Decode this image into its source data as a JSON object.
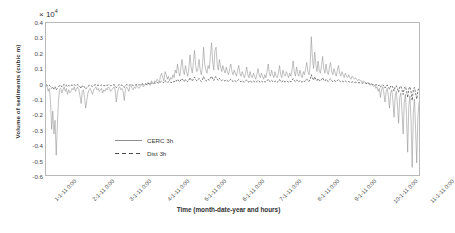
{
  "chart_data": {
    "type": "line",
    "title": "",
    "xlabel": "Time (month-date-year and hours)",
    "ylabel": "Volume of sediments (cubic m)",
    "y_multiplier": "× 10",
    "y_multiplier_exp": "4",
    "ylim": [
      -0.6,
      0.4
    ],
    "yticks": [
      "0.4",
      "0.3",
      "0.2",
      "0.1",
      "0",
      "-0.1",
      "-0.2",
      "-0.3",
      "-0.4",
      "-0.5",
      "-0.6"
    ],
    "grid": false,
    "legend_position": "inside-left",
    "xticks": [
      "1-1-11 0:00",
      "2-1-11 0:00",
      "3-1-11 0:00",
      "4-1-11 0:00",
      "5-1-11 0:00",
      "6-1-11 0:00",
      "7-1-11 0:00",
      "8-1-11 0:00",
      "9-1-11 0:00",
      "10-1-11 0:00",
      "11-1-11 0:00"
    ],
    "series": [
      {
        "name": "CERC 3h",
        "style": "solid",
        "color": "#8e8e8e",
        "values": [
          -0.01,
          -0.02,
          -0.05,
          -0.03,
          -0.12,
          -0.3,
          -0.18,
          -0.33,
          -0.24,
          -0.47,
          -0.28,
          -0.11,
          -0.04,
          -0.03,
          -0.06,
          -0.04,
          -0.02,
          -0.05,
          -0.03,
          -0.07,
          -0.04,
          -0.06,
          -0.05,
          -0.03,
          -0.04,
          -0.02,
          -0.05,
          -0.03,
          -0.02,
          -0.04,
          -0.08,
          -0.13,
          -0.05,
          -0.04,
          -0.09,
          -0.16,
          -0.11,
          -0.06,
          -0.04,
          -0.03,
          -0.05,
          -0.07,
          -0.04,
          -0.03,
          -0.02,
          -0.04,
          -0.03,
          -0.05,
          -0.04,
          -0.03,
          -0.06,
          -0.04,
          -0.05,
          -0.03,
          -0.04,
          -0.02,
          -0.03,
          -0.05,
          -0.04,
          -0.03,
          -0.02,
          -0.04,
          -0.12,
          -0.06,
          -0.03,
          -0.02,
          -0.04,
          -0.03,
          -0.05,
          -0.11,
          -0.04,
          -0.02,
          -0.03,
          -0.05,
          -0.02,
          -0.01,
          -0.03,
          -0.04,
          -0.02,
          -0.03,
          -0.01,
          -0.02,
          -0.03,
          -0.02,
          -0.01,
          0.0,
          -0.02,
          -0.01,
          0.0,
          -0.01,
          0.01,
          0.0,
          -0.01,
          0.02,
          0.01,
          0.0,
          0.02,
          0.01,
          0.03,
          0.02,
          0.01,
          0.05,
          0.07,
          0.04,
          0.02,
          0.08,
          0.06,
          0.03,
          0.05,
          0.02,
          0.04,
          0.03,
          0.06,
          0.04,
          0.09,
          0.07,
          0.13,
          0.08,
          0.05,
          0.11,
          0.16,
          0.09,
          0.06,
          0.12,
          0.08,
          0.05,
          0.1,
          0.19,
          0.11,
          0.07,
          0.14,
          0.22,
          0.12,
          0.08,
          0.1,
          0.16,
          0.09,
          0.06,
          0.11,
          0.24,
          0.13,
          0.09,
          0.07,
          0.12,
          0.1,
          0.18,
          0.27,
          0.15,
          0.09,
          0.22,
          0.24,
          0.13,
          0.09,
          0.16,
          0.11,
          0.08,
          0.12,
          0.09,
          0.07,
          0.11,
          0.08,
          0.06,
          0.1,
          0.13,
          0.08,
          0.06,
          0.09,
          0.07,
          0.05,
          0.09,
          0.12,
          0.07,
          0.05,
          0.08,
          0.06,
          0.04,
          0.07,
          0.11,
          0.06,
          0.04,
          0.08,
          0.05,
          0.04,
          0.07,
          0.05,
          0.03,
          0.06,
          0.1,
          0.06,
          0.04,
          0.07,
          0.05,
          0.03,
          0.06,
          0.04,
          0.08,
          0.13,
          0.07,
          0.05,
          0.09,
          0.06,
          0.04,
          0.08,
          0.05,
          0.04,
          0.07,
          0.12,
          0.06,
          0.04,
          0.09,
          0.06,
          0.05,
          0.08,
          0.06,
          0.04,
          0.07,
          0.05,
          0.09,
          0.15,
          0.08,
          0.05,
          0.11,
          0.07,
          0.05,
          0.09,
          0.06,
          0.04,
          0.08,
          0.06,
          0.1,
          0.14,
          0.08,
          0.06,
          0.12,
          0.31,
          0.17,
          0.1,
          0.21,
          0.13,
          0.08,
          0.15,
          0.09,
          0.07,
          0.12,
          0.18,
          0.1,
          0.07,
          0.13,
          0.08,
          0.06,
          0.11,
          0.14,
          0.08,
          0.06,
          0.1,
          0.07,
          0.05,
          0.09,
          0.12,
          0.07,
          0.05,
          0.08,
          0.06,
          0.04,
          0.07,
          0.05,
          0.04,
          0.06,
          0.04,
          0.03,
          0.05,
          0.04,
          0.03,
          0.04,
          0.03,
          0.02,
          0.03,
          0.02,
          0.02,
          0.01,
          0.02,
          0.01,
          0.01,
          0.0,
          0.01,
          0.0,
          -0.01,
          0.0,
          -0.01,
          -0.02,
          -0.01,
          -0.03,
          -0.02,
          -0.05,
          -0.03,
          -0.09,
          -0.04,
          -0.02,
          -0.06,
          -0.12,
          -0.05,
          -0.03,
          -0.08,
          -0.16,
          -0.06,
          -0.04,
          -0.11,
          -0.22,
          -0.08,
          -0.05,
          -0.14,
          -0.26,
          -0.09,
          -0.06,
          -0.18,
          -0.33,
          -0.12,
          -0.07,
          -0.21,
          -0.45,
          -0.15,
          -0.08,
          -0.25,
          -0.55,
          -0.19,
          -0.1,
          -0.3,
          -0.52,
          -0.22,
          -0.12
        ]
      },
      {
        "name": "Dist 3h",
        "style": "dashed",
        "color": "#4a4a4a",
        "values": [
          -0.005,
          -0.01,
          -0.015,
          -0.01,
          -0.02,
          -0.03,
          -0.02,
          -0.035,
          -0.02,
          -0.04,
          -0.03,
          -0.02,
          -0.01,
          -0.01,
          -0.02,
          -0.01,
          -0.005,
          -0.015,
          -0.01,
          -0.02,
          -0.01,
          -0.015,
          -0.01,
          -0.008,
          -0.012,
          -0.006,
          -0.014,
          -0.009,
          -0.006,
          -0.011,
          -0.02,
          -0.03,
          -0.014,
          -0.011,
          -0.022,
          -0.035,
          -0.025,
          -0.016,
          -0.011,
          -0.008,
          -0.014,
          -0.018,
          -0.011,
          -0.008,
          -0.006,
          -0.011,
          -0.008,
          -0.013,
          -0.011,
          -0.008,
          -0.015,
          -0.011,
          -0.013,
          -0.008,
          -0.011,
          -0.006,
          -0.008,
          -0.013,
          -0.011,
          -0.008,
          -0.006,
          -0.011,
          -0.025,
          -0.015,
          -0.008,
          -0.006,
          -0.011,
          -0.008,
          -0.013,
          -0.024,
          -0.011,
          -0.006,
          -0.008,
          -0.013,
          -0.006,
          -0.004,
          -0.008,
          -0.011,
          -0.006,
          -0.008,
          -0.004,
          -0.006,
          -0.008,
          -0.006,
          -0.004,
          0.0,
          -0.006,
          -0.004,
          0.0,
          -0.004,
          0.003,
          0.0,
          -0.004,
          0.006,
          0.003,
          0.0,
          0.006,
          0.003,
          0.008,
          0.006,
          0.003,
          0.013,
          0.018,
          0.011,
          0.006,
          0.02,
          0.015,
          0.008,
          0.013,
          0.006,
          0.011,
          0.008,
          0.015,
          0.011,
          0.022,
          0.018,
          0.03,
          0.02,
          0.013,
          0.026,
          0.035,
          0.022,
          0.015,
          0.028,
          0.02,
          0.013,
          0.024,
          0.04,
          0.026,
          0.018,
          0.032,
          0.045,
          0.028,
          0.02,
          0.024,
          0.035,
          0.022,
          0.015,
          0.026,
          0.048,
          0.03,
          0.022,
          0.018,
          0.028,
          0.024,
          0.038,
          0.05,
          0.033,
          0.022,
          0.044,
          0.046,
          0.03,
          0.022,
          0.035,
          0.026,
          0.02,
          0.028,
          0.022,
          0.018,
          0.026,
          0.02,
          0.015,
          0.024,
          0.03,
          0.02,
          0.015,
          0.022,
          0.018,
          0.013,
          0.022,
          0.028,
          0.018,
          0.013,
          0.02,
          0.015,
          0.011,
          0.018,
          0.026,
          0.015,
          0.011,
          0.02,
          0.013,
          0.011,
          0.018,
          0.013,
          0.008,
          0.015,
          0.024,
          0.015,
          0.011,
          0.018,
          0.013,
          0.008,
          0.015,
          0.011,
          0.02,
          0.03,
          0.018,
          0.013,
          0.022,
          0.015,
          0.011,
          0.02,
          0.013,
          0.011,
          0.018,
          0.028,
          0.015,
          0.011,
          0.022,
          0.015,
          0.013,
          0.02,
          0.015,
          0.011,
          0.018,
          0.013,
          0.022,
          0.034,
          0.02,
          0.013,
          0.026,
          0.018,
          0.013,
          0.022,
          0.015,
          0.011,
          0.02,
          0.015,
          0.024,
          0.032,
          0.02,
          0.015,
          0.028,
          0.06,
          0.038,
          0.024,
          0.046,
          0.03,
          0.02,
          0.035,
          0.022,
          0.018,
          0.028,
          0.04,
          0.024,
          0.018,
          0.03,
          0.02,
          0.015,
          0.026,
          0.032,
          0.02,
          0.015,
          0.024,
          0.018,
          0.013,
          0.022,
          0.028,
          0.018,
          0.013,
          0.02,
          0.015,
          0.011,
          0.018,
          0.013,
          0.011,
          0.015,
          0.011,
          0.008,
          0.013,
          0.011,
          0.008,
          0.011,
          0.008,
          0.006,
          0.008,
          0.006,
          0.006,
          0.004,
          0.006,
          0.004,
          0.004,
          0.0,
          0.003,
          0.0,
          -0.003,
          0.0,
          -0.004,
          -0.006,
          -0.004,
          -0.008,
          -0.006,
          -0.013,
          -0.008,
          -0.022,
          -0.011,
          -0.006,
          -0.015,
          -0.028,
          -0.013,
          -0.008,
          -0.02,
          -0.035,
          -0.015,
          -0.011,
          -0.026,
          -0.048,
          -0.02,
          -0.013,
          -0.032,
          -0.055,
          -0.022,
          -0.015,
          -0.04,
          -0.07,
          -0.028,
          -0.018,
          -0.046,
          -0.09,
          -0.033,
          -0.02,
          -0.052,
          -0.11,
          -0.04,
          -0.024,
          -0.062,
          -0.1,
          -0.046,
          -0.028
        ]
      }
    ]
  },
  "legend": {
    "items": [
      {
        "label": "CERC 3h",
        "style": "solid"
      },
      {
        "label": "Dist 3h",
        "style": "dashed"
      }
    ]
  }
}
